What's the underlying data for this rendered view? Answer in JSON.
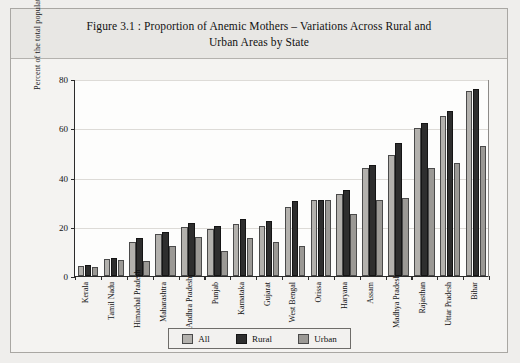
{
  "title": {
    "line1": "Figure 3.1 : Proportion of Anemic Mothers – Variations Across Rural and",
    "line2": "Urban Areas by State"
  },
  "legend": {
    "items": [
      {
        "label": "All",
        "color": "#b3b1ad"
      },
      {
        "label": "Rural",
        "color": "#2e2e2e"
      },
      {
        "label": "Urban",
        "color": "#9b9995"
      }
    ]
  },
  "chart_data": {
    "type": "bar",
    "title": "Figure 3.1 : Proportion of Anemic Mothers – Variations Across Rural and Urban Areas by State",
    "xlabel": "",
    "ylabel": "Percent of the total population of mothers surveyed",
    "ylim": [
      0,
      80
    ],
    "yticks": [
      0,
      20,
      40,
      60,
      80
    ],
    "grid": true,
    "legend_position": "bottom",
    "categories": [
      "Kerala",
      "Tamil Nadu",
      "Himachal Pradesh",
      "Maharashtra",
      "Andhra Pradesh",
      "Punjab",
      "Karnataka",
      "Gujarat",
      "West Bengal",
      "Orissa",
      "Haryana",
      "Assam",
      "Madhya Pradesh",
      "Rajasthan",
      "Uttar Pradesh",
      "Bihar"
    ],
    "series": [
      {
        "name": "All",
        "color": "#b3b1ad",
        "values": [
          4,
          7,
          14,
          17,
          20,
          19,
          21,
          20.5,
          28,
          31,
          33.5,
          44,
          49,
          60,
          65,
          75
        ]
      },
      {
        "name": "Rural",
        "color": "#2e2e2e",
        "values": [
          4.5,
          7.5,
          15.5,
          18,
          21.5,
          20.5,
          23,
          22.5,
          30.5,
          31,
          35,
          45,
          54,
          62,
          67,
          76
        ]
      },
      {
        "name": "Urban",
        "color": "#9b9995",
        "values": [
          3.5,
          6.5,
          6,
          12,
          16,
          10,
          15.5,
          14,
          12,
          31,
          25,
          31,
          31.5,
          44,
          46,
          53
        ]
      }
    ]
  }
}
